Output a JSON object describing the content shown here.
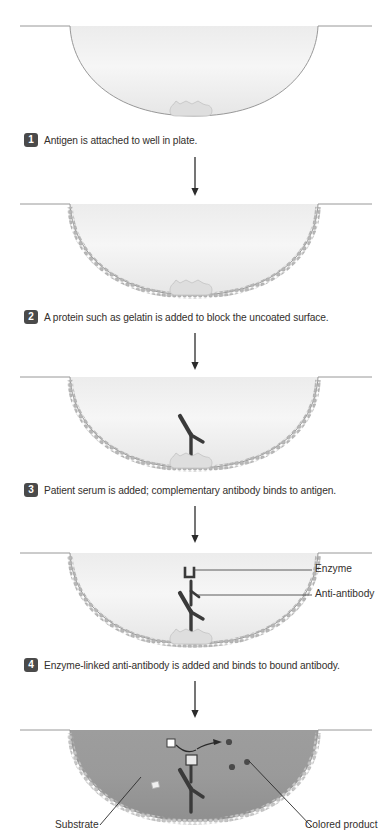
{
  "figure": {
    "type": "process-diagram",
    "panel_count": 5
  },
  "steps": [
    {
      "number": "1",
      "text": "Antigen is attached to well in plate.",
      "contents": [
        "antigen"
      ]
    },
    {
      "number": "2",
      "text": "A protein such as gelatin is added to block the uncoated surface.",
      "contents": [
        "antigen",
        "gelatin-coating"
      ]
    },
    {
      "number": "3",
      "text": "Patient serum is added; complementary antibody binds to antigen.",
      "contents": [
        "antigen",
        "gelatin-coating",
        "antibody"
      ]
    },
    {
      "number": "4",
      "text": "Enzyme-linked anti-antibody is added and binds to bound antibody.",
      "contents": [
        "antigen",
        "gelatin-coating",
        "antibody",
        "anti-antibody",
        "enzyme"
      ]
    },
    {
      "number": "5",
      "text": "",
      "contents": [
        "antigen",
        "gelatin-coating",
        "antibody",
        "anti-antibody",
        "enzyme",
        "substrate",
        "colored-product"
      ]
    }
  ],
  "callouts": {
    "enzyme": "Enzyme",
    "anti_antibody": "Anti-antibody",
    "substrate": "Substrate",
    "colored_product": "Colored product"
  },
  "icons": {
    "down_arrow": "down-arrow-icon",
    "reaction_arrow": "curved-reaction-arrow-icon"
  },
  "colors": {
    "well_outline": "#6e6e6e",
    "well_fill_light": "#f2f2f2",
    "well_fill_shade": "#e3e3e3",
    "gelatin_bead": "#b0b0b0",
    "antigen": "#dcdcdc",
    "antibody": "#3a3a3a",
    "badge_bg": "#4a4a4a",
    "badge_text": "#ffffff",
    "text": "#332f2c",
    "colored_well_fill": "#9a9a9a",
    "substrate_square": "#ffffff",
    "product_dot": "#4a4a4a",
    "callout_line": "#4a4a4a"
  }
}
